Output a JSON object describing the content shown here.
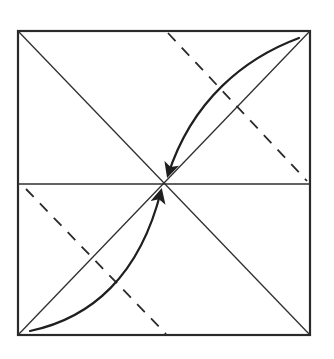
{
  "diagram": {
    "type": "origami-fold-instruction",
    "description": "Square paper with both diagonals and a horizontal center crease; two dashed valley-fold lines parallel to the anti-diagonal; curved arrows show the top-right and bottom-left corners folding to the center.",
    "colors": {
      "background": "#ffffff",
      "stroke": "#2a2a2a"
    },
    "square": {
      "x1": 18,
      "y1": 31,
      "x2": 310,
      "y2": 335
    },
    "center": {
      "x": 164,
      "y": 183
    },
    "creases": [
      {
        "name": "diagonal-main",
        "from": [
          18,
          31
        ],
        "to": [
          310,
          335
        ],
        "style": "solid"
      },
      {
        "name": "diagonal-anti",
        "from": [
          310,
          31
        ],
        "to": [
          18,
          335
        ],
        "style": "solid"
      },
      {
        "name": "horizontal-center",
        "from": [
          18,
          184
        ],
        "to": [
          310,
          184
        ],
        "style": "solid"
      }
    ],
    "fold_lines": [
      {
        "name": "upper-valley-fold",
        "from": [
          168,
          33
        ],
        "to": [
          307,
          181
        ],
        "style": "dashed"
      },
      {
        "name": "lower-valley-fold",
        "from": [
          26,
          189
        ],
        "to": [
          166,
          334
        ],
        "style": "dashed"
      }
    ],
    "arrows": [
      {
        "name": "top-right-corner-to-center",
        "from": [
          299,
          38
        ],
        "to": [
          167,
          177
        ],
        "curve": "above-diagonal"
      },
      {
        "name": "bottom-left-corner-to-center",
        "from": [
          30,
          331
        ],
        "to": [
          161,
          189
        ],
        "curve": "below-diagonal"
      }
    ]
  }
}
